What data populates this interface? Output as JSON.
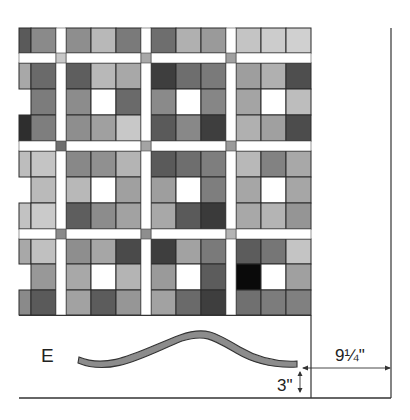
{
  "diagram": {
    "piece_label": "E",
    "dimension_horizontal": "9¼\"",
    "dimension_vertical": "3\"",
    "colors": {
      "sashing": "#ffffff",
      "outline": "#2a2a2a",
      "wave_fill": "#8c8c8c",
      "line": "#333333"
    },
    "grid": {
      "columns_x": [
        [
          19,
          31
        ],
        [
          31,
          56
        ],
        [
          66,
          91
        ],
        [
          91,
          116
        ],
        [
          116,
          141
        ],
        [
          151,
          176
        ],
        [
          176,
          201
        ],
        [
          201,
          226
        ],
        [
          236,
          261
        ],
        [
          261,
          286
        ],
        [
          286,
          311
        ]
      ],
      "rows_y": [
        [
          28,
          53
        ],
        [
          63,
          89
        ],
        [
          89,
          115
        ],
        [
          115,
          141
        ],
        [
          151,
          177
        ],
        [
          177,
          203
        ],
        [
          203,
          229
        ],
        [
          239,
          264
        ],
        [
          264,
          290
        ],
        [
          290,
          315
        ]
      ],
      "sashing_cornerstones": [
        {
          "x": 56,
          "y": 53,
          "shade": "#c8c8c8"
        },
        {
          "x": 141,
          "y": 53,
          "shade": "#a8a8a8"
        },
        {
          "x": 226,
          "y": 53,
          "shade": "#a0a0a0"
        },
        {
          "x": 56,
          "y": 141,
          "shade": "#6e6e6e"
        },
        {
          "x": 141,
          "y": 141,
          "shade": "#a4a4a4"
        },
        {
          "x": 226,
          "y": 141,
          "shade": "#9a9a9a"
        },
        {
          "x": 56,
          "y": 229,
          "shade": "#8a8a8a"
        },
        {
          "x": 141,
          "y": 229,
          "shade": "#8e8e8e"
        },
        {
          "x": 226,
          "y": 229,
          "shade": "#b4b4b4"
        }
      ],
      "shades": [
        [
          "#5a5a5a",
          "#8a8a8a",
          "#8e8e8e",
          "#b8b8b8",
          "#7a7a7a",
          "#6e6e6e",
          "#b0b0b0",
          "#9a9a9a",
          "#c4c4c4",
          "#cccccc",
          "#d0d0d0"
        ],
        [
          "#a8a8a8",
          "#6a6a6a",
          "#5e5e5e",
          "#b8b8b8",
          "#a8a8a8",
          "#3e3e3e",
          "#6e6e6e",
          "#7a7a7a",
          "#9e9e9e",
          "#b0b0b0",
          "#4e4e4e"
        ],
        [
          null,
          "#7c7c7c",
          "#8c8c8c",
          "#ffffff",
          "#6a6a6a",
          "#8a8a8a",
          "#ffffff",
          "#868686",
          "#a4a4a4",
          "#ffffff",
          "#bdbdbd"
        ],
        [
          "#2e2e2e",
          "#7e7e7e",
          "#8e8e8e",
          "#a0a0a0",
          "#c8c8c8",
          "#5a5a5a",
          "#888888",
          "#3e3e3e",
          "#b0b0b0",
          "#a0a0a0",
          "#4c4c4c"
        ],
        [
          "#bdbdbd",
          "#c4c4c4",
          "#888888",
          "#909090",
          "#b4b4b4",
          "#5a5a5a",
          "#6e6e6e",
          "#7e7e7e",
          "#b8b8b8",
          "#828282",
          "#a8a8a8"
        ],
        [
          null,
          "#bababa",
          "#b8b8b8",
          "#ffffff",
          "#a0a0a0",
          "#9e9e9e",
          "#ffffff",
          "#7e7e7e",
          "#a6a6a6",
          "#ffffff",
          "#a6a6a6"
        ],
        [
          "#c2c2c2",
          "#cacaca",
          "#5e5e5e",
          "#8c8c8c",
          "#a2a2a2",
          "#a8a8a8",
          "#5a5a5a",
          "#3a3a3a",
          "#a8a8a8",
          "#b4b4b4",
          "#959595"
        ],
        [
          "#a8a8a8",
          "#c0c0c0",
          "#8e8e8e",
          "#a6a6a6",
          "#4a4a4a",
          "#3e3e3e",
          "#a2a2a2",
          "#7a7a7a",
          "#5c5c5c",
          "#767676",
          "#c4c4c4"
        ],
        [
          null,
          "#989898",
          "#a8a8a8",
          "#ffffff",
          "#b4b4b4",
          "#9a9a9a",
          "#ffffff",
          "#5c5c5c",
          "#0a0a0a",
          "#ffffff",
          "#a0a0a0"
        ],
        [
          "#8a8a8a",
          "#5a5a5a",
          "#a2a2a2",
          "#5c5c5c",
          "#969696",
          "#a2a2a2",
          "#6a6a6a",
          "#3e3e3e",
          "#707070",
          "#7c7c7c",
          "#808080"
        ]
      ]
    }
  }
}
